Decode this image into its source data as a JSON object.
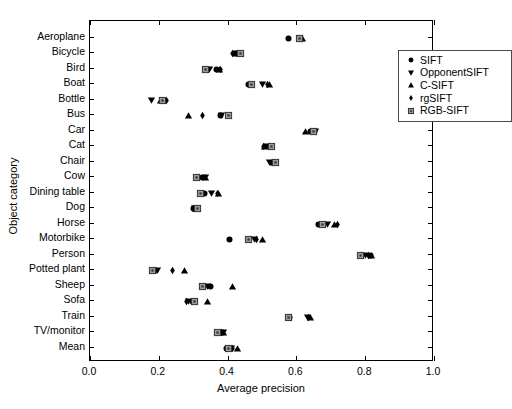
{
  "chart_data": {
    "type": "scatter",
    "title": "",
    "xlabel": "Average precision",
    "ylabel": "Object category",
    "xlim": [
      0.0,
      1.0
    ],
    "xticks": [
      0.0,
      0.2,
      0.4,
      0.6,
      0.8,
      1.0
    ],
    "xticklabels": [
      "0.0",
      "0.2",
      "0.4",
      "0.6",
      "0.8",
      "1.0"
    ],
    "grid": false,
    "legend_position": "top-right inside",
    "categories": [
      "Aeroplane",
      "Bicycle",
      "Bird",
      "Boat",
      "Bottle",
      "Bus",
      "Car",
      "Cat",
      "Chair",
      "Cow",
      "Dining table",
      "Dog",
      "Horse",
      "Motorbike",
      "Person",
      "Potted plant",
      "Sheep",
      "Sofa",
      "Train",
      "TV/monitor",
      "Mean"
    ],
    "series": [
      {
        "name": "SIFT",
        "marker": "circle",
        "values": [
          0.574,
          0.424,
          0.363,
          0.455,
          0.213,
          0.374,
          0.637,
          0.516,
          0.525,
          0.322,
          0.329,
          0.296,
          0.66,
          0.4,
          0.812,
          0.185,
          0.345,
          0.295,
          0.575,
          0.378,
          0.393
        ]
      },
      {
        "name": "OpponentSIFT",
        "marker": "triangle-down",
        "values": [
          0.606,
          0.42,
          0.343,
          0.498,
          0.174,
          0.378,
          0.652,
          0.51,
          0.518,
          0.331,
          0.348,
          0.3,
          0.687,
          0.474,
          0.796,
          0.193,
          0.338,
          0.283,
          0.629,
          0.385,
          0.408
        ]
      },
      {
        "name": "C-SIFT",
        "marker": "triangle-up",
        "values": [
          0.612,
          0.42,
          0.372,
          0.516,
          0.2,
          0.283,
          0.623,
          0.503,
          0.528,
          0.33,
          0.37,
          0.303,
          0.706,
          0.497,
          0.815,
          0.27,
          0.41,
          0.337,
          0.638,
          0.383,
          0.424
        ]
      },
      {
        "name": "rgSIFT",
        "marker": "diamond",
        "values": [
          0.61,
          0.41,
          0.375,
          0.512,
          0.218,
          0.323,
          0.65,
          0.501,
          0.53,
          0.315,
          0.365,
          0.296,
          0.714,
          0.481,
          0.805,
          0.236,
          0.328,
          0.276,
          0.63,
          0.377,
          0.411
        ]
      },
      {
        "name": "RGB-SIFT",
        "marker": "square",
        "values": [
          0.604,
          0.434,
          0.33,
          0.465,
          0.206,
          0.398,
          0.645,
          0.523,
          0.536,
          0.305,
          0.317,
          0.309,
          0.671,
          0.455,
          0.783,
          0.176,
          0.322,
          0.3,
          0.573,
          0.367,
          0.399
        ]
      }
    ],
    "legend": [
      "SIFT",
      "OpponentSIFT",
      "C-SIFT",
      "rgSIFT",
      "RGB-SIFT"
    ],
    "colors": {
      "marker_fill": "#000000",
      "square_fill": "#9a9a9a",
      "square_edge": "#333333",
      "axis": "#000000",
      "background": "#ffffff"
    }
  }
}
